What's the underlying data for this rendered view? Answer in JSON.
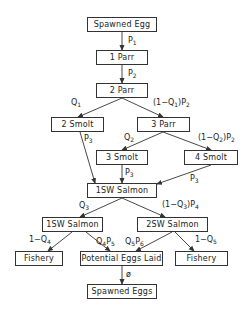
{
  "diagram": {
    "type": "life-cycle flow diagram",
    "nodes": {
      "spawned_egg": "Spawned Egg",
      "parr1": "1 Parr",
      "parr2": "2 Parr",
      "smolt2": "2 Smolt",
      "parr3": "3 Parr",
      "smolt3": "3 Smolt",
      "smolt4": "4 Smolt",
      "sw1_mid": "1SW Salmon",
      "sw1_left": "1SW Salmon",
      "sw2": "2SW Salmon",
      "fishery_left": "Fishery",
      "eggs_laid": "Potential Eggs Laid",
      "fishery_right": "Fishery",
      "spawned_eggs": "Spawned Eggs"
    },
    "edges": {
      "egg_to_parr1": {
        "base": "P",
        "sub": "1",
        "tail": ""
      },
      "parr1_to_parr2": {
        "base": "P",
        "sub": "2",
        "tail": ""
      },
      "parr2_to_smolt2": {
        "base": "Q",
        "sub": "1",
        "tail": ""
      },
      "parr2_to_parr3": {
        "pre": "(1−Q",
        "sub": "1",
        "tail": ")P",
        "sub2": "2"
      },
      "smolt2_to_sw1": {
        "base": "P",
        "sub": "3",
        "tail": ""
      },
      "parr3_to_smolt3": {
        "base": "Q",
        "sub": "2",
        "tail": ""
      },
      "parr3_to_smolt4": {
        "pre": "(1−Q",
        "sub": "2",
        "tail": ")P",
        "sub2": "2"
      },
      "smolt3_to_sw1": {
        "base": "P",
        "sub": "3",
        "tail": ""
      },
      "smolt4_to_sw1": {
        "base": "P",
        "sub": "3",
        "tail": ""
      },
      "sw1_to_sw1left": {
        "base": "Q",
        "sub": "3",
        "tail": ""
      },
      "sw1_to_sw2": {
        "pre": "(1−Q",
        "sub": "3",
        "tail": ")P",
        "sub2": "4"
      },
      "sw1left_to_fishery": {
        "pre": "1−Q",
        "sub": "4"
      },
      "sw1left_to_eggs": {
        "base": "Q",
        "sub": "4",
        "tail": "P",
        "sub2": "5"
      },
      "sw2_to_eggs": {
        "base": "Q",
        "sub": "5",
        "tail": "P",
        "sub2": "6"
      },
      "sw2_to_fishery": {
        "pre": "1−Q",
        "sub": "5"
      },
      "eggs_to_spawned": {
        "base": "ø"
      }
    }
  }
}
